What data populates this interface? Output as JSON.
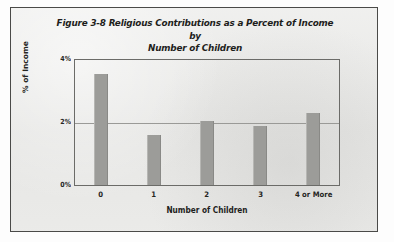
{
  "figure": {
    "background_color": "#e9e9e7",
    "frame_color": "#4a4a48",
    "title_line1": "Figure 3-8 Religious Contributions as a Percent of Income by",
    "title_line2": "Number of Children"
  },
  "chart_data": {
    "type": "bar",
    "title": "Figure 3-8 Religious Contributions as a Percent of Income by Number of Children",
    "xlabel": "Number of Children",
    "ylabel": "% of Income",
    "categories": [
      "0",
      "1",
      "2",
      "3",
      "4 or More"
    ],
    "values": [
      3.55,
      1.6,
      2.05,
      1.9,
      2.3
    ],
    "ylim": [
      0,
      4
    ],
    "yticks": [
      0,
      2,
      4
    ],
    "ytick_labels": [
      "0%",
      "2%",
      "4%"
    ],
    "grid": "horizontal-2pct-only",
    "legend": "none",
    "bar_color": "#9c9c99",
    "gridline_color": "#9a9a97",
    "axis_color": "#6b6b68"
  }
}
